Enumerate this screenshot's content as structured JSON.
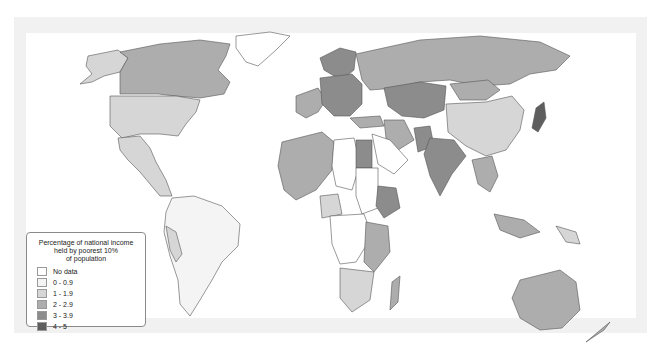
{
  "map": {
    "type": "choropleth-world-map",
    "background_frame_color": "#f1f1f1",
    "ocean_color": "#ffffff",
    "border_color": "#555555"
  },
  "legend": {
    "title": "Percentage of national income held by poorest 10% of population",
    "title_lines": [
      "Percentage of national income",
      "held by poorest 10%",
      "of population"
    ],
    "items": [
      {
        "label": "No data",
        "color": "#ffffff"
      },
      {
        "label": "0 - 0.9",
        "color": "#f4f4f4"
      },
      {
        "label": "1 - 1.9",
        "color": "#d6d6d6"
      },
      {
        "label": "2 - 2.9",
        "color": "#adadad"
      },
      {
        "label": "3 - 3.9",
        "color": "#8c8c8c"
      },
      {
        "label": "4 - 5",
        "color": "#5e5e5e"
      }
    ]
  },
  "regions": [
    {
      "name": "Canada",
      "class": "2 - 2.9"
    },
    {
      "name": "United States",
      "class": "1 - 1.9"
    },
    {
      "name": "Mexico",
      "class": "1 - 1.9"
    },
    {
      "name": "South America",
      "class": "0 - 0.9"
    },
    {
      "name": "Greenland",
      "class": "No data"
    },
    {
      "name": "Russia",
      "class": "2 - 2.9"
    },
    {
      "name": "Scandinavia",
      "class": "3 - 3.9"
    },
    {
      "name": "Eastern Europe",
      "class": "3 - 3.9"
    },
    {
      "name": "Western Europe",
      "class": "2 - 2.9"
    },
    {
      "name": "Central Asia",
      "class": "3 - 3.9"
    },
    {
      "name": "China",
      "class": "1 - 1.9"
    },
    {
      "name": "Mongolia",
      "class": "2 - 2.9"
    },
    {
      "name": "Japan",
      "class": "4 - 5"
    },
    {
      "name": "India",
      "class": "3 - 3.9"
    },
    {
      "name": "Pakistan",
      "class": "3 - 3.9"
    },
    {
      "name": "Iran",
      "class": "2 - 2.9"
    },
    {
      "name": "Egypt",
      "class": "3 - 3.9"
    },
    {
      "name": "Ethiopia",
      "class": "3 - 3.9"
    },
    {
      "name": "North-West Africa",
      "class": "2 - 2.9"
    },
    {
      "name": "Central Africa",
      "class": "No data"
    },
    {
      "name": "Southern Africa",
      "class": "1 - 1.9"
    },
    {
      "name": "Madagascar",
      "class": "2 - 2.9"
    },
    {
      "name": "Southeast Asia",
      "class": "2 - 2.9"
    },
    {
      "name": "Indonesia",
      "class": "2 - 2.9"
    },
    {
      "name": "Australia",
      "class": "2 - 2.9"
    },
    {
      "name": "New Zealand",
      "class": "2 - 2.9"
    }
  ]
}
